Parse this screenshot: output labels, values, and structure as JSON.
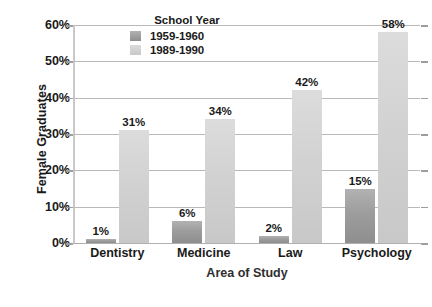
{
  "chart_data": {
    "type": "bar",
    "title": "",
    "xlabel": "Area of Study",
    "ylabel": "Female Graduates",
    "categories": [
      "Dentistry",
      "Medicine",
      "Law",
      "Psychology"
    ],
    "series": [
      {
        "name": "1959-1960",
        "color": "#9d9d9d",
        "values": [
          1,
          6,
          2,
          15
        ],
        "value_labels": [
          "1%",
          "6%",
          "2%",
          "15%"
        ]
      },
      {
        "name": "1989-1990",
        "color": "#d2d2d2",
        "values": [
          31,
          34,
          42,
          58
        ],
        "value_labels": [
          "31%",
          "34%",
          "42%",
          "58%"
        ]
      }
    ],
    "ylim": [
      0,
      60
    ],
    "ytick_values": [
      0,
      10,
      20,
      30,
      40,
      50,
      60
    ],
    "ytick_labels": [
      "0%",
      "10%",
      "20%",
      "30%",
      "40%",
      "50%",
      "60%"
    ],
    "grid": true,
    "legend_position": "top-center-inside",
    "legend_title": "School Year"
  },
  "legend": {
    "title": "School Year",
    "entries": [
      {
        "label": "1959-1960",
        "swatch": "old"
      },
      {
        "label": "1989-1990",
        "swatch": "new"
      }
    ]
  },
  "axes": {
    "y_title": "Female Graduates",
    "x_title": "Area of Study"
  }
}
